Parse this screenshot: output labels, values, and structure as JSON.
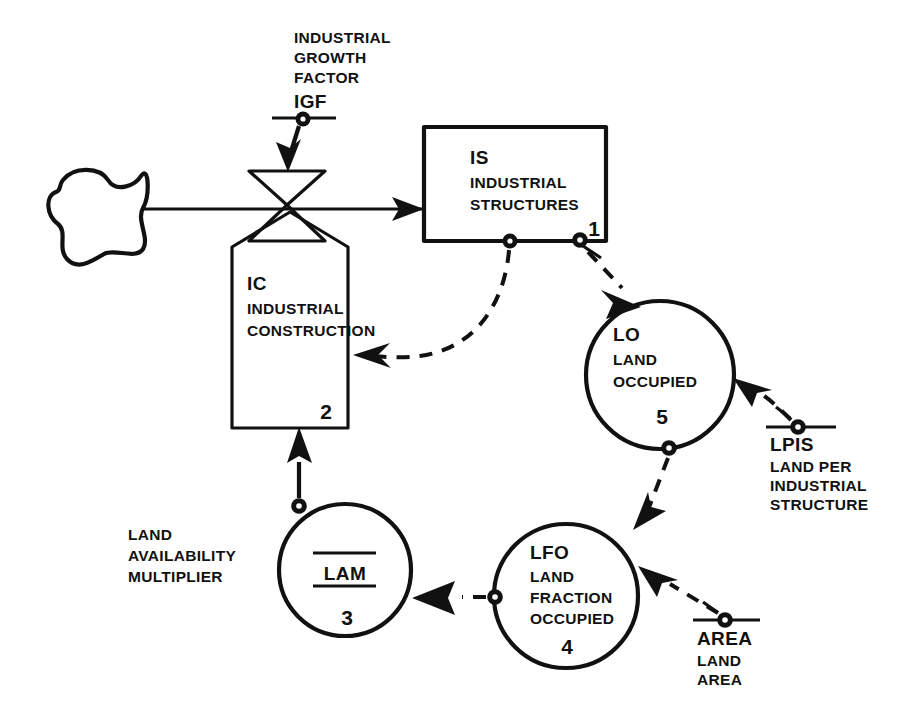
{
  "diagram": {
    "type": "system-dynamics-flow-diagram",
    "colors": {
      "ink": "#111111",
      "background": "#ffffff"
    },
    "nodes": {
      "igf": {
        "id": "IGF",
        "kind": "constant",
        "abbrev": "IGF",
        "label_lines": [
          "INDUSTRIAL",
          "GROWTH",
          "FACTOR"
        ],
        "number": ""
      },
      "source_cloud": {
        "id": "source",
        "kind": "cloud",
        "abbrev": "",
        "label_lines": [],
        "number": ""
      },
      "ic": {
        "id": "IC",
        "kind": "rate",
        "abbrev": "IC",
        "label_lines": [
          "INDUSTRIAL",
          "CONSTRUCTION"
        ],
        "number": "2"
      },
      "is": {
        "id": "IS",
        "kind": "level",
        "abbrev": "IS",
        "label_lines": [
          "INDUSTRIAL",
          "STRUCTURES"
        ],
        "number": "1"
      },
      "lo": {
        "id": "LO",
        "kind": "auxiliary",
        "abbrev": "LO",
        "label_lines": [
          "LAND",
          "OCCUPIED"
        ],
        "number": "5"
      },
      "lpis": {
        "id": "LPIS",
        "kind": "constant",
        "abbrev": "LPIS",
        "label_lines": [
          "LAND PER",
          "INDUSTRIAL",
          "STRUCTURE"
        ],
        "number": ""
      },
      "lfo": {
        "id": "LFO",
        "kind": "auxiliary",
        "abbrev": "LFO",
        "label_lines": [
          "LAND",
          "FRACTION",
          "OCCUPIED"
        ],
        "number": "4"
      },
      "area": {
        "id": "AREA",
        "kind": "constant",
        "abbrev": "AREA",
        "label_lines": [
          "LAND",
          "AREA"
        ],
        "number": ""
      },
      "lam": {
        "id": "LAM",
        "kind": "table-auxiliary",
        "abbrev": "LAM",
        "label_lines": [],
        "number": "3",
        "external_label_lines": [
          "LAND",
          "AVAILABILITY",
          "MULTIPLIER"
        ]
      }
    },
    "connections": [
      {
        "from": "source_cloud",
        "to": "ic",
        "style": "solid-flow"
      },
      {
        "from": "igf",
        "to": "ic",
        "style": "solid-arrow"
      },
      {
        "from": "ic",
        "to": "is",
        "style": "solid-flow"
      },
      {
        "from": "is",
        "to": "ic",
        "style": "dashed-info"
      },
      {
        "from": "is",
        "to": "lo",
        "style": "dashed-info"
      },
      {
        "from": "lpis",
        "to": "lo",
        "style": "dashed-info"
      },
      {
        "from": "lo",
        "to": "lfo",
        "style": "dashed-info"
      },
      {
        "from": "area",
        "to": "lfo",
        "style": "dashed-info"
      },
      {
        "from": "lfo",
        "to": "lam",
        "style": "dashed-info"
      },
      {
        "from": "lam",
        "to": "ic",
        "style": "solid-arrow"
      }
    ]
  }
}
